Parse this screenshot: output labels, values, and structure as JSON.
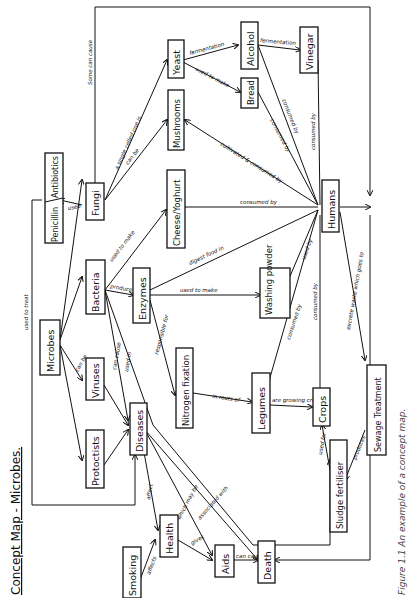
{
  "title": "Concept Map - Microbes.",
  "caption": "Figure 1.1  An example of a concept map.",
  "nodes": {
    "microbes": "Microbes",
    "viruses": "Viruses",
    "protoctists": "Protoctists",
    "bacteria": "Bacteria",
    "fungi": "Fungi",
    "penicillin": "Penicillin",
    "antibiotics": "Antibiotics",
    "yeast": "Yeast",
    "mushrooms": "Mushrooms",
    "cheese_yoghurt": "Cheese/Yoghurt",
    "enzymes": "Enzymes",
    "washing_powder": "Washing powder",
    "nitrogen_fixation": "Nitrogen fixation",
    "legumes": "Legumes",
    "crops": "Crops",
    "alcohol": "Alcohol",
    "bread": "Bread",
    "vinegar": "Vinegar",
    "humans": "Humans",
    "diseases": "Diseases",
    "health": "Health",
    "smoking": "Smoking",
    "aids": "Aids",
    "death": "Death",
    "sludge_fertiliser": "Sludge fertiliser",
    "sewage_treatment": "Sewage Treatment"
  },
  "edges": {
    "used_to_treat": "used to treat",
    "can_be": "can be",
    "can_be2": "be",
    "some_can_cause": "Some can cause",
    "used": "used",
    "single_celled": "a single celled one is",
    "can_be_fungi": "can be",
    "fermentation1": "fermentation",
    "fermentation2": "fermentation",
    "used_to_make_bread": "used to make",
    "used_to_make_cheese": "used to make",
    "produce": "produce",
    "digest_food": "digest food in",
    "used_to_make_wp": "used to make",
    "responsible_for": "responsible for",
    "can_cause": "can cause",
    "used_in": "used in",
    "some_cause": "some cause",
    "some_cause2": "some cause",
    "in_roots_of": "in roots of",
    "are_crops": "are growing crops",
    "consumed_by_cy": "consumed by",
    "cultivated_consumed": "cultivated & consumed by",
    "consumed_by_bread": "consumed by",
    "consumed_by_alcohol": "consumed by",
    "consumed_by_vinegar": "consumed by",
    "used_by": "used by",
    "consumed_by_leg": "consumed by",
    "consumed_by_crops": "consumed by",
    "excrete_waste": "excrete waste which goes to",
    "used_for": "used for",
    "produces": "produces",
    "eventually_die": "eventually die",
    "affect": "affect",
    "affects": "affects",
    "which_may_be": "which may be",
    "gives": "gives",
    "bad_health": "bad health",
    "associated_with": "associated with",
    "can_cause_death": "can cause"
  }
}
